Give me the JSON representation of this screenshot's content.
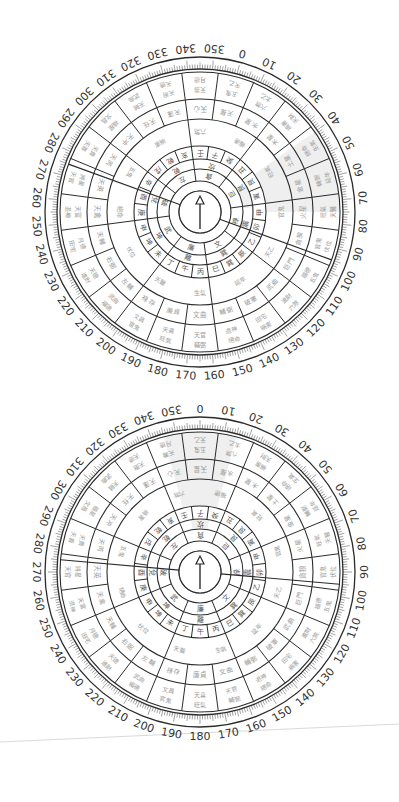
{
  "page": {
    "background": "#ffffff",
    "line_color": "#2b2b2b",
    "shade_color": "#efefef",
    "faint_text_color": "#9a9a9a",
    "separator_line_color": "#cfcfcf"
  },
  "dials": [
    {
      "id": "top",
      "center": [
        200,
        212
      ],
      "rotation_deg": 15,
      "pointer": "arrow-north",
      "shaded_sector": {
        "from": 40,
        "to": 75
      },
      "degree_labels": [
        "0",
        "10",
        "20",
        "30",
        "40",
        "50",
        "60",
        "70",
        "80",
        "90",
        "100",
        "110",
        "120",
        "130",
        "140",
        "150",
        "160",
        "170",
        "180",
        "190",
        "200",
        "210",
        "220",
        "230",
        "240",
        "250",
        "260",
        "270",
        "280",
        "290",
        "300",
        "310",
        "320",
        "330",
        "340",
        "350"
      ]
    },
    {
      "id": "bottom",
      "center": [
        200,
        572
      ],
      "rotation_deg": 0,
      "pointer": "arrow-north",
      "shaded_sector": {
        "from": 345,
        "to": 15
      },
      "degree_labels": [
        "0",
        "10",
        "20",
        "30",
        "40",
        "50",
        "60",
        "70",
        "80",
        "90",
        "100",
        "110",
        "120",
        "130",
        "140",
        "150",
        "160",
        "170",
        "180",
        "190",
        "200",
        "210",
        "220",
        "230",
        "240",
        "250",
        "260",
        "270",
        "280",
        "290",
        "300",
        "310",
        "320",
        "330",
        "340",
        "350"
      ]
    }
  ],
  "rings": {
    "mountains_24": [
      "子",
      "癸",
      "丑",
      "艮",
      "寅",
      "甲",
      "卯",
      "乙",
      "辰",
      "巽",
      "巳",
      "丙",
      "午",
      "丁",
      "未",
      "坤",
      "申",
      "庚",
      "酉",
      "辛",
      "戌",
      "乾",
      "亥",
      "壬"
    ],
    "trigram_8": [
      "坎",
      "艮",
      "震",
      "巽",
      "離",
      "坤",
      "兌",
      "乾"
    ],
    "stars_9": [
      "貪狼",
      "巨門",
      "祿存",
      "文曲",
      "廉貞",
      "武曲",
      "破軍",
      "左輔",
      "右弼"
    ],
    "outer_cells_note": "faint multi-character annotations"
  },
  "outer_cell_labels": [
    "天乙",
    "太乙",
    "天財",
    "生氣",
    "延年",
    "天醫",
    "伏位",
    "五鬼",
    "六煞",
    "禍害",
    "絕命",
    "輔弼",
    "旺氣",
    "官鬼",
    "福德",
    "進財",
    "田宅",
    "退神",
    "天官",
    "天喜",
    "文昌",
    "武曲",
    "天德",
    "月德",
    "天富",
    "將星",
    "天貴",
    "福星",
    "天賊",
    "天廚",
    "天壽",
    "天印",
    "天祿",
    "天馬",
    "天福",
    "天恩"
  ],
  "middle_cell_labels": [
    "天星",
    "水星",
    "木星",
    "土星",
    "金星",
    "火星",
    "貪狼",
    "巨門",
    "武曲",
    "破軍",
    "輔弼",
    "文曲",
    "廉貞",
    "祿存",
    "左輔",
    "右弼",
    "天輔",
    "天禽",
    "天英",
    "天芮",
    "天冲",
    "天任",
    "天蓬",
    "天心"
  ],
  "inner_band_labels": [
    "福德",
    "旺氣",
    "官鬼",
    "天乙",
    "延年",
    "生氣",
    "天醫",
    "伏位",
    "絕命",
    "五鬼",
    "禍害",
    "六煞"
  ]
}
